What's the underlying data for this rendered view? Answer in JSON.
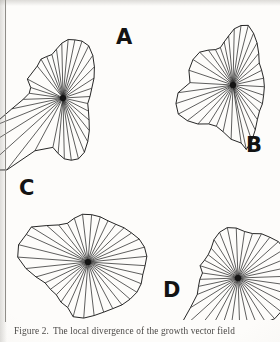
{
  "figure": {
    "caption_label": "Figure 2.",
    "caption_text": "The local divergence of the growth vector field",
    "panels": [
      {
        "id": "A",
        "label": "A",
        "label_x": 116,
        "label_y": 27,
        "center_x": 63,
        "center_y": 98,
        "main_rx": 34,
        "main_ry": 54,
        "rotation": -8,
        "spike_angle": 228,
        "spike_length": 108,
        "spike_width": 26,
        "spoke_count": 36
      },
      {
        "id": "B",
        "label": "B",
        "label_x": 246,
        "label_y": 135,
        "center_x": 233,
        "center_y": 85,
        "main_rx": 33,
        "main_ry": 52,
        "rotation": 28,
        "spike_angle": 185,
        "spike_length": 62,
        "spike_width": 46,
        "spoke_count": 36
      },
      {
        "id": "C",
        "label": "C",
        "label_x": 19,
        "label_y": 178,
        "center_x": 88,
        "center_y": 262,
        "main_rx": 48,
        "main_ry": 44,
        "rotation": -4,
        "spike_angle": 196,
        "spike_length": 72,
        "spike_width": 30,
        "spoke_count": 36
      },
      {
        "id": "D",
        "label": "D",
        "label_x": 163,
        "label_y": 280,
        "center_x": 238,
        "center_y": 278,
        "main_rx": 42,
        "main_ry": 42,
        "rotation": 12,
        "spike_angle": 232,
        "spike_length": 110,
        "spike_width": 22,
        "spoke_count": 36
      }
    ]
  },
  "chart_data": {
    "type": "polar-rose",
    "title": "The local divergence of the growth vector field",
    "series": [
      {
        "name": "A",
        "note": "elongated vertical rose with long narrow lobe toward upper-left",
        "angles_deg": [
          0,
          10,
          20,
          30,
          40,
          50,
          60,
          70,
          80,
          90,
          100,
          110,
          120,
          130,
          140,
          150,
          160,
          170,
          180,
          190,
          200,
          210,
          220,
          230,
          240,
          250,
          260,
          270,
          280,
          290,
          300,
          310,
          320,
          330,
          340,
          350
        ],
        "radii": [
          34,
          36,
          40,
          45,
          50,
          54,
          56,
          55,
          52,
          50,
          46,
          42,
          40,
          41,
          44,
          44,
          40,
          34,
          34,
          40,
          52,
          78,
          104,
          108,
          92,
          60,
          44,
          48,
          52,
          54,
          55,
          54,
          50,
          45,
          40,
          36
        ]
      },
      {
        "name": "B",
        "note": "tilted rose with broad polygonal lobe toward the left",
        "angles_deg": [
          0,
          10,
          20,
          30,
          40,
          50,
          60,
          70,
          80,
          90,
          100,
          110,
          120,
          130,
          140,
          150,
          160,
          170,
          180,
          190,
          200,
          210,
          220,
          230,
          240,
          250,
          260,
          270,
          280,
          290,
          300,
          310,
          320,
          330,
          340,
          350
        ],
        "radii": [
          40,
          44,
          48,
          52,
          54,
          52,
          48,
          42,
          38,
          36,
          38,
          44,
          52,
          58,
          60,
          58,
          56,
          60,
          62,
          58,
          52,
          46,
          44,
          48,
          54,
          58,
          58,
          54,
          48,
          44,
          42,
          42,
          42,
          42,
          41,
          40
        ]
      },
      {
        "name": "C",
        "note": "near-circular rose with a wedge lobe toward the left",
        "angles_deg": [
          0,
          10,
          20,
          30,
          40,
          50,
          60,
          70,
          80,
          90,
          100,
          110,
          120,
          130,
          140,
          150,
          160,
          170,
          180,
          190,
          200,
          210,
          220,
          230,
          240,
          250,
          260,
          270,
          280,
          290,
          300,
          310,
          320,
          330,
          340,
          350
        ],
        "radii": [
          48,
          50,
          50,
          48,
          46,
          44,
          42,
          42,
          43,
          44,
          44,
          42,
          40,
          42,
          48,
          58,
          68,
          72,
          70,
          62,
          54,
          48,
          46,
          46,
          48,
          50,
          52,
          52,
          50,
          48,
          48,
          49,
          50,
          50,
          49,
          48
        ]
      },
      {
        "name": "D",
        "note": "rose with a very long slender lobe toward the upper-left",
        "angles_deg": [
          0,
          10,
          20,
          30,
          40,
          50,
          60,
          70,
          80,
          90,
          100,
          110,
          120,
          130,
          140,
          150,
          160,
          170,
          180,
          190,
          200,
          210,
          220,
          230,
          240,
          250,
          260,
          270,
          280,
          290,
          300,
          310,
          320,
          330,
          340,
          350
        ],
        "radii": [
          42,
          44,
          46,
          46,
          44,
          42,
          40,
          40,
          42,
          44,
          42,
          38,
          34,
          32,
          32,
          34,
          36,
          38,
          40,
          44,
          56,
          84,
          110,
          106,
          78,
          50,
          40,
          40,
          42,
          44,
          46,
          46,
          45,
          44,
          43,
          42
        ]
      }
    ],
    "angle_units": "degrees",
    "radius_units": "pixels",
    "legend": [
      "A",
      "B",
      "C",
      "D"
    ],
    "grid": false
  }
}
